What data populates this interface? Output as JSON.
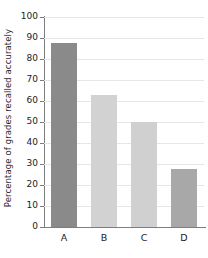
{
  "chart_data": {
    "type": "bar",
    "title": "",
    "subtitle": "",
    "xlabel": "",
    "ylabel": "Percentage of grades recalled accurately",
    "categories": [
      "A",
      "B",
      "C",
      "D"
    ],
    "values": [
      87.5,
      63,
      50,
      27.5
    ],
    "series": [
      {
        "name": "Percentage of grades recalled accurately",
        "values": [
          87.5,
          63,
          50,
          27.5
        ]
      }
    ],
    "bar_colors": [
      "#8a8a8a",
      "#d2d2d2",
      "#d0d0d0",
      "#a8a8a8"
    ],
    "ylim": [
      0,
      100
    ],
    "xlim_categories": 4,
    "y_ticks": [
      0,
      10,
      20,
      30,
      40,
      50,
      60,
      70,
      80,
      90,
      100
    ],
    "y_tick_labels": [
      "0",
      "10",
      "20",
      "30",
      "40",
      "50",
      "60",
      "70",
      "80",
      "90",
      "100"
    ],
    "x_tick_labels": [
      "A",
      "B",
      "C",
      "D"
    ],
    "grid": {
      "horizontal": true,
      "vertical": false,
      "color": "#e6e6e6"
    },
    "legend": {
      "visible": false,
      "position": "none",
      "entries": []
    },
    "annotations": [],
    "axis_color": "#7d7d7d",
    "background_color": "#ffffff",
    "text_color": "#222222"
  }
}
